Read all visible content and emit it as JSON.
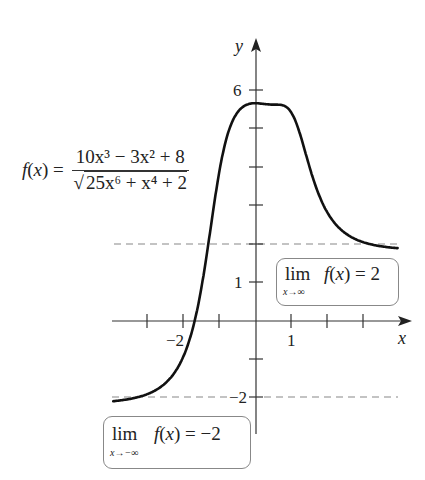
{
  "chart_data": {
    "type": "line",
    "title": "",
    "function": "f(x) = (10x^3 - 3x^2 + 8) / sqrt(25x^6 + x^4 + 2)",
    "xlabel": "x",
    "ylabel": "y",
    "xlim": [
      -2.0,
      2.0
    ],
    "ylim": [
      -2.5,
      6.5
    ],
    "x_ticks": [
      -1.5,
      -1,
      -0.5,
      0.5,
      1,
      1.5
    ],
    "x_tick_labels": [
      {
        "value": -1,
        "label": "−2"
      },
      {
        "value": 0.5,
        "label": "1"
      }
    ],
    "y_ticks": [
      -2,
      -1,
      1,
      2,
      3,
      4,
      5,
      6
    ],
    "y_tick_labels": [
      {
        "value": 6,
        "label": "6"
      },
      {
        "value": 1,
        "label": "1"
      },
      {
        "value": -2,
        "label": "−2"
      }
    ],
    "asymptotes": [
      {
        "y": 2,
        "style": "dashed",
        "annotation": "lim x→∞ f(x) = 2"
      },
      {
        "y": -2,
        "style": "dashed",
        "annotation": "lim x→−∞ f(x) = −2"
      }
    ],
    "series": [
      {
        "name": "f(x)",
        "x": [
          -2.0,
          -1.5,
          -1.0,
          -0.75,
          -0.6,
          -0.5,
          -0.4,
          -0.3,
          -0.2,
          -0.1,
          0.0,
          0.1,
          0.2,
          0.3,
          0.4,
          0.5,
          0.6,
          0.75,
          1.0,
          1.5,
          2.0
        ],
        "y": [
          -2.0,
          -2.0,
          -1.98,
          -1.9,
          -1.7,
          -1.3,
          -0.4,
          1.6,
          3.9,
          5.3,
          5.66,
          5.6,
          5.2,
          4.3,
          3.5,
          2.9,
          2.55,
          2.25,
          2.06,
          2.0,
          2.0
        ]
      }
    ],
    "grid": false,
    "legend": null
  },
  "labels": {
    "y_axis": "y",
    "x_axis": "x",
    "tick_6": "6",
    "tick_1_y": "1",
    "tick_neg2_y": "−2",
    "tick_neg2_x": "−2",
    "tick_1_x": "1"
  },
  "formula": {
    "lhs": "f(x) =",
    "numerator": "10x³ − 3x² + 8",
    "denominator": "25x⁶ + x⁴ + 2"
  },
  "limit_right": {
    "lim": "lim",
    "sub": "x→∞",
    "rest": "f(x) = 2"
  },
  "limit_left": {
    "lim": "lim",
    "sub": "x→−∞",
    "rest": "f(x) = −2"
  },
  "colors": {
    "curve": "#111111",
    "axis": "#333333",
    "asymptote": "#888888",
    "box_border": "#888888"
  }
}
